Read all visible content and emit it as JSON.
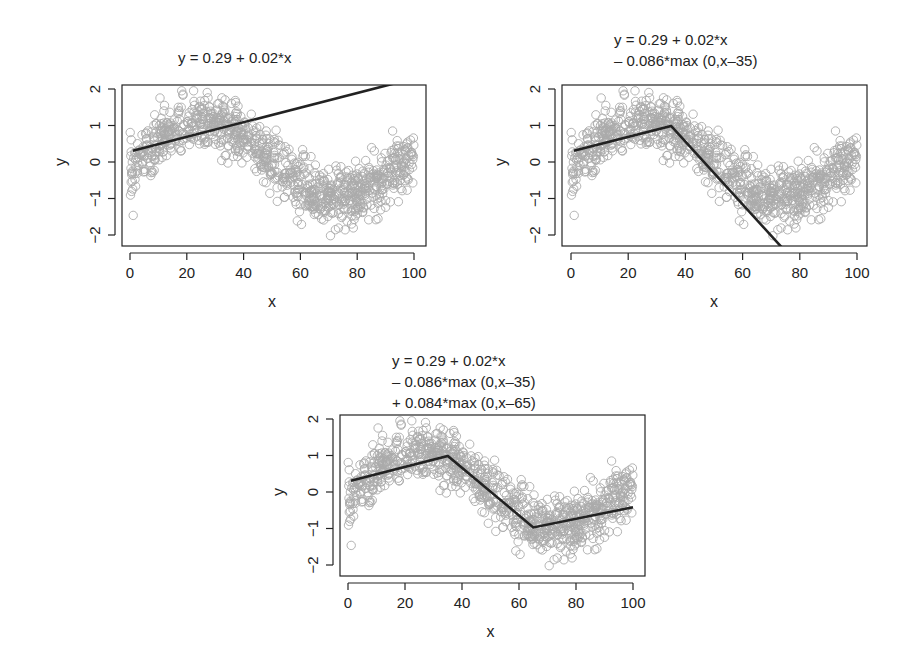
{
  "chart_data": [
    {
      "type": "scatter",
      "panel": "top-left",
      "title": "y = 0.29 + 0.02*x",
      "title_lines": [
        "y = 0.29 + 0.02*x"
      ],
      "xlabel": "x",
      "ylabel": "y",
      "xlim": [
        0,
        100
      ],
      "ylim": [
        -2,
        2
      ],
      "xticks": [
        0,
        20,
        40,
        60,
        80,
        100
      ],
      "yticks": [
        -2,
        -1,
        0,
        1,
        2
      ],
      "grid": false,
      "scatter": {
        "n": 1000,
        "marker": "open-circle",
        "color": "#aaaaaa",
        "model": "sin(2*pi*x/100)-ish + noise; y in approx [-2.1, 2.0]"
      },
      "fit_line": {
        "color": "#222222",
        "points": [
          [
            1,
            0.31
          ],
          [
            100,
            2.29
          ]
        ],
        "formula": {
          "intercept": 0.29,
          "slope": 0.02,
          "hinges": []
        }
      }
    },
    {
      "type": "scatter",
      "panel": "top-right",
      "title": "y = 0.29 + 0.02*x - 0.086*max (0,x-35)",
      "title_lines": [
        "y = 0.29 + 0.02*x",
        "– 0.086*max (0,x–35)"
      ],
      "xlabel": "x",
      "ylabel": "y",
      "xlim": [
        0,
        100
      ],
      "ylim": [
        -2,
        2
      ],
      "xticks": [
        0,
        20,
        40,
        60,
        80,
        100
      ],
      "yticks": [
        -2,
        -1,
        0,
        1,
        2
      ],
      "grid": false,
      "scatter": {
        "n": 1000,
        "marker": "open-circle",
        "color": "#aaaaaa"
      },
      "fit_line": {
        "color": "#222222",
        "points": [
          [
            1,
            0.31
          ],
          [
            35,
            0.99
          ],
          [
            100,
            -4.6
          ]
        ],
        "formula": {
          "intercept": 0.29,
          "slope": 0.02,
          "hinges": [
            {
              "knot": 35,
              "coef": -0.086
            }
          ]
        }
      }
    },
    {
      "type": "scatter",
      "panel": "bottom-center",
      "title": "y = 0.29 + 0.02*x - 0.086*max (0,x-35) + 0.084*max (0,x-65)",
      "title_lines": [
        "y = 0.29 + 0.02*x",
        "– 0.086*max (0,x–35)",
        "+ 0.084*max (0,x–65)"
      ],
      "xlabel": "x",
      "ylabel": "y",
      "xlim": [
        0,
        100
      ],
      "ylim": [
        -2,
        2
      ],
      "xticks": [
        0,
        20,
        40,
        60,
        80,
        100
      ],
      "yticks": [
        -2,
        -1,
        0,
        1,
        2
      ],
      "grid": false,
      "scatter": {
        "n": 1000,
        "marker": "open-circle",
        "color": "#aaaaaa"
      },
      "fit_line": {
        "color": "#222222",
        "points": [
          [
            1,
            0.31
          ],
          [
            35,
            0.99
          ],
          [
            65,
            -0.97
          ],
          [
            100,
            -0.42
          ]
        ],
        "formula": {
          "intercept": 0.29,
          "slope": 0.02,
          "hinges": [
            {
              "knot": 35,
              "coef": -0.086
            },
            {
              "knot": 65,
              "coef": 0.084
            }
          ]
        }
      }
    }
  ],
  "layout": {
    "panels": [
      {
        "frame": {
          "left": 122,
          "top": 85,
          "right": 426,
          "bottom": 246
        },
        "x0px": 130,
        "x100px": 414,
        "y2px": 89,
        "ym2px": 235,
        "title_pos": {
          "left": 178,
          "top": 47
        }
      },
      {
        "frame": {
          "left": 562,
          "top": 85,
          "right": 867,
          "bottom": 246
        },
        "x0px": 571,
        "x100px": 857,
        "y2px": 89,
        "ym2px": 235,
        "title_pos": {
          "left": 614,
          "top": 29
        }
      },
      {
        "frame": {
          "left": 340,
          "top": 415,
          "right": 645,
          "bottom": 576
        },
        "x0px": 348,
        "x100px": 633,
        "y2px": 419,
        "ym2px": 565,
        "title_pos": {
          "left": 392,
          "top": 350
        }
      }
    ]
  }
}
